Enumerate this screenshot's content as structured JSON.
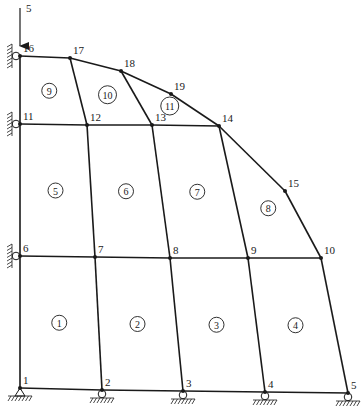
{
  "diagram": {
    "type": "finite-element-mesh",
    "load": {
      "label": "5",
      "node": 16,
      "direction": "down"
    },
    "nodes": [
      {
        "id": 1,
        "label": "1",
        "x": 20,
        "y": 388
      },
      {
        "id": 2,
        "label": "2",
        "x": 102,
        "y": 390
      },
      {
        "id": 3,
        "label": "3",
        "x": 183,
        "y": 391
      },
      {
        "id": 4,
        "label": "4",
        "x": 265,
        "y": 392
      },
      {
        "id": 5,
        "label": "5",
        "x": 348,
        "y": 393
      },
      {
        "id": 6,
        "label": "6",
        "x": 20,
        "y": 256
      },
      {
        "id": 7,
        "label": "7",
        "x": 95,
        "y": 257
      },
      {
        "id": 8,
        "label": "8",
        "x": 170,
        "y": 258
      },
      {
        "id": 9,
        "label": "9",
        "x": 248,
        "y": 258
      },
      {
        "id": 10,
        "label": "10",
        "x": 321,
        "y": 258
      },
      {
        "id": 11,
        "label": "11",
        "x": 20,
        "y": 124
      },
      {
        "id": 12,
        "label": "12",
        "x": 87,
        "y": 125
      },
      {
        "id": 13,
        "label": "13",
        "x": 152,
        "y": 125
      },
      {
        "id": 14,
        "label": "14",
        "x": 219,
        "y": 126
      },
      {
        "id": 15,
        "label": "15",
        "x": 285,
        "y": 191
      },
      {
        "id": 16,
        "label": "16",
        "x": 20,
        "y": 56
      },
      {
        "id": 17,
        "label": "17",
        "x": 70,
        "y": 58
      },
      {
        "id": 18,
        "label": "18",
        "x": 121,
        "y": 71
      },
      {
        "id": 19,
        "label": "19",
        "x": 171,
        "y": 94
      }
    ],
    "elements": [
      {
        "id": 1,
        "label": "1",
        "nodes": [
          1,
          2,
          7,
          6
        ]
      },
      {
        "id": 2,
        "label": "2",
        "nodes": [
          2,
          3,
          8,
          7
        ]
      },
      {
        "id": 3,
        "label": "3",
        "nodes": [
          3,
          4,
          9,
          8
        ]
      },
      {
        "id": 4,
        "label": "4",
        "nodes": [
          4,
          5,
          10,
          9
        ]
      },
      {
        "id": 5,
        "label": "5",
        "nodes": [
          6,
          7,
          12,
          11
        ]
      },
      {
        "id": 6,
        "label": "6",
        "nodes": [
          7,
          8,
          13,
          12
        ]
      },
      {
        "id": 7,
        "label": "7",
        "nodes": [
          8,
          9,
          14,
          13
        ]
      },
      {
        "id": 8,
        "label": "8",
        "nodes": [
          9,
          10,
          15,
          14
        ]
      },
      {
        "id": 9,
        "label": "9",
        "nodes": [
          11,
          12,
          17,
          16
        ]
      },
      {
        "id": 10,
        "label": "10",
        "nodes": [
          12,
          13,
          18,
          17
        ]
      },
      {
        "id": 11,
        "label": "11",
        "nodes": [
          13,
          14,
          19,
          18
        ]
      }
    ],
    "supports": {
      "fixed_pin": [
        1
      ],
      "roller_bottom": [
        2,
        3,
        4,
        5
      ],
      "roller_left": [
        6,
        11,
        16
      ]
    },
    "colors": {
      "line": "#1a1a1a",
      "background": "#ffffff"
    }
  }
}
